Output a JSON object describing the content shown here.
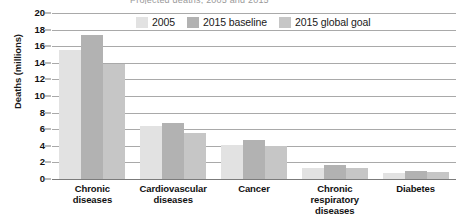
{
  "clipped_title": "Projected deaths, 2005 and 2015",
  "legend": {
    "position": "top-center",
    "items": [
      {
        "label": "2005",
        "color": "#e2e2e2"
      },
      {
        "label": "2015 baseline",
        "color": "#b2b2b2"
      },
      {
        "label": "2015 global goal",
        "color": "#c6c6c6"
      }
    ]
  },
  "chart_data": {
    "type": "bar",
    "title": "",
    "xlabel": "",
    "ylabel": "Deaths (millions)",
    "ylim": [
      0,
      20
    ],
    "yticks": [
      0,
      2,
      4,
      6,
      8,
      10,
      12,
      14,
      16,
      18,
      20
    ],
    "ytick_labels": [
      "0",
      "2",
      "4",
      "6",
      "8",
      "10",
      "12",
      "14",
      "16",
      "18",
      "20"
    ],
    "grid": true,
    "grid_axis": "y",
    "categories": [
      "Chronic\ndiseases",
      "Cardiovascular\ndiseases",
      "Cancer",
      "Chronic\nrespiratory\ndiseases",
      "Diabetes"
    ],
    "category_lines": [
      [
        "Chronic",
        "diseases"
      ],
      [
        "Cardiovascular",
        "diseases"
      ],
      [
        "Cancer"
      ],
      [
        "Chronic",
        "respiratory",
        "diseases"
      ],
      [
        "Diabetes"
      ]
    ],
    "series": [
      {
        "name": "2005",
        "color": "#e2e2e2",
        "values": [
          15.6,
          6.4,
          4.1,
          1.3,
          0.75
        ]
      },
      {
        "name": "2015 baseline",
        "color": "#b2b2b2",
        "values": [
          17.3,
          6.7,
          4.7,
          1.7,
          1.0
        ]
      },
      {
        "name": "2015 global goal",
        "color": "#c6c6c6",
        "values": [
          13.8,
          5.6,
          4.0,
          1.3,
          0.8
        ]
      }
    ]
  }
}
